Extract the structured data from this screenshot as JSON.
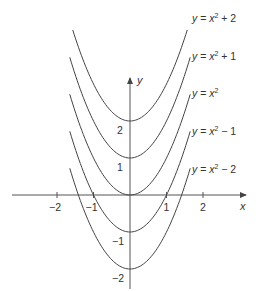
{
  "chart_data": {
    "type": "line",
    "title": "",
    "xlabel": "x",
    "ylabel": "y",
    "xlim": [
      -3.2,
      3.2
    ],
    "ylim": [
      -2.5,
      4.5
    ],
    "grid": false,
    "legend_position": "inline-right",
    "x_ticks": [
      -2,
      -1,
      1,
      2
    ],
    "x_tick_labels": [
      "−2",
      "−1",
      "1",
      "2"
    ],
    "y_ticks": [
      -2,
      -1,
      1,
      2
    ],
    "y_tick_labels": [
      "−2",
      "−1",
      "1",
      "2"
    ],
    "series": [
      {
        "name": "y = x^2 + 2",
        "label_base": "y = x",
        "label_suffix": " + 2",
        "c": 2
      },
      {
        "name": "y = x^2 + 1",
        "label_base": "y = x",
        "label_suffix": " + 1",
        "c": 1
      },
      {
        "name": "y = x^2",
        "label_base": "y = x",
        "label_suffix": "",
        "c": 0
      },
      {
        "name": "y = x^2 − 1",
        "label_base": "y = x",
        "label_suffix": " − 1",
        "c": -1
      },
      {
        "name": "y = x^2 − 2",
        "label_base": "y = x",
        "label_suffix": " − 2",
        "c": -2
      }
    ],
    "color": "#444444"
  },
  "axes": {
    "x_label": "x",
    "y_label": "y"
  }
}
